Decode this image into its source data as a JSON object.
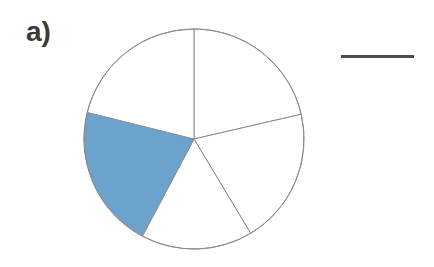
{
  "figure": {
    "panel_label": "a)",
    "background_color": "#ffffff",
    "width": 434,
    "height": 267
  },
  "pie": {
    "center_x": 194,
    "center_y": 139,
    "radius": 110,
    "stroke_color": "#8c8c8c",
    "stroke_width": 1,
    "unfilled_color": "#ffffff",
    "highlight_color": "#6ba3cd"
  },
  "legend": {
    "line_color": "#4c4c4c",
    "line_length": 73,
    "line_thickness": 3,
    "line_x": 341,
    "line_y": 55,
    "label": ""
  },
  "chart_data": {
    "type": "pie",
    "title": "a)",
    "xlabel": "",
    "ylabel": "",
    "categories": [
      "Slice 1",
      "Slice 2",
      "Slice 3",
      "Slice 4",
      "Slice 5"
    ],
    "values": [
      20,
      20,
      20,
      20,
      20
    ],
    "legend_position": "right",
    "grid": false,
    "annotations": [
      "a)"
    ],
    "slices": [
      {
        "index": 0,
        "label": "Slice 1",
        "value": 20,
        "percent": 20,
        "start_angle_deg": -90,
        "end_angle_deg": -13,
        "highlighted": false,
        "fill": "#ffffff"
      },
      {
        "index": 1,
        "label": "Slice 2",
        "value": 20,
        "percent": 20,
        "start_angle_deg": -13,
        "end_angle_deg": 59,
        "highlighted": false,
        "fill": "#ffffff"
      },
      {
        "index": 2,
        "label": "Slice 3",
        "value": 20,
        "percent": 20,
        "start_angle_deg": 59,
        "end_angle_deg": 118,
        "highlighted": false,
        "fill": "#ffffff"
      },
      {
        "index": 3,
        "label": "Slice 4",
        "value": 20,
        "percent": 20,
        "start_angle_deg": 118,
        "end_angle_deg": 194,
        "highlighted": true,
        "fill": "#6ba3cd"
      },
      {
        "index": 4,
        "label": "Slice 5",
        "value": 20,
        "percent": 20,
        "start_angle_deg": 194,
        "end_angle_deg": 270,
        "highlighted": false,
        "fill": "#ffffff"
      }
    ]
  }
}
